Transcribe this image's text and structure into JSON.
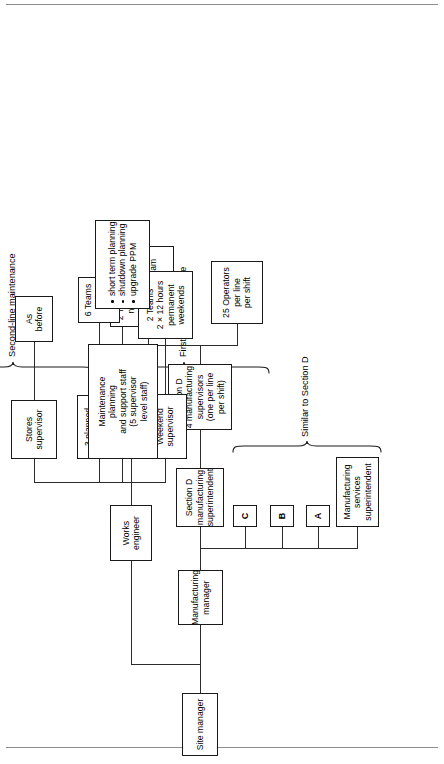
{
  "figure": {
    "kind": "organization-chart",
    "orientation": "rotated-90-ccw",
    "root_label": "Site manager"
  },
  "nodes": {
    "site_manager": {
      "lines": [
        "Site manager"
      ]
    },
    "manufacturing_manager": {
      "lines": [
        "Manufacturing",
        "manager"
      ]
    },
    "works_engineer": {
      "lines": [
        "Works",
        "engineer"
      ]
    },
    "manufacturing_services_superintendent": {
      "lines": [
        "Manufacturing",
        "services",
        "superintendent"
      ]
    },
    "section_a": {
      "lines": [
        "A"
      ]
    },
    "section_b": {
      "lines": [
        "B"
      ]
    },
    "section_c": {
      "lines": [
        "C"
      ]
    },
    "section_d_superintendent": {
      "lines": [
        "Section D",
        "manufacturing",
        "superintendent"
      ]
    },
    "section_d_supervisors": {
      "lines": [
        "Section D",
        "4 manufacturing",
        "supervisors",
        "(one per line",
        "per shift)"
      ]
    },
    "day_evening_team": {
      "left": [
        "1 Day",
        "team"
      ],
      "right": [
        "1 Evening",
        "team"
      ]
    },
    "operators": {
      "lines": [
        "25 Operators",
        "per line",
        "per shift"
      ]
    },
    "permanent_night_shift_supervisor": {
      "lines": [
        "Permanent",
        "night shift",
        "supervisor"
      ]
    },
    "two_teams_night_shift": {
      "lines": [
        "2 Teams",
        "night",
        "shift"
      ]
    },
    "planned_maintenance_supervisors": {
      "lines": [
        "3 planned",
        "maintenance",
        "supervisors"
      ]
    },
    "six_teams_night_shift": {
      "lines": [
        "6 Teams",
        "night",
        "shift"
      ]
    },
    "weekend_supervisor": {
      "lines": [
        "Weekend",
        "supervisor"
      ]
    },
    "two_teams_weekends": {
      "lines": [
        "2 Teams",
        "2 × 12 hours",
        "permanent",
        "weekends"
      ]
    },
    "maintenance_planning": {
      "lines": [
        "Maintenance",
        "planning",
        "and support staff",
        "(5 supervisor",
        "level staff)"
      ]
    },
    "planning_tasks": {
      "bullets": [
        "short term planning",
        "shutdown planning",
        "upgrade PPM"
      ]
    },
    "stores_supervisor": {
      "lines": [
        "Stores",
        "supervisor"
      ]
    },
    "as_before": {
      "lines": [
        "As",
        "before"
      ]
    }
  },
  "braces": {
    "similar_to_section_d": "Similar to Section D",
    "first_line_maintenance": "First-line maintenance",
    "second_line_maintenance": "Second-line maintenance"
  }
}
